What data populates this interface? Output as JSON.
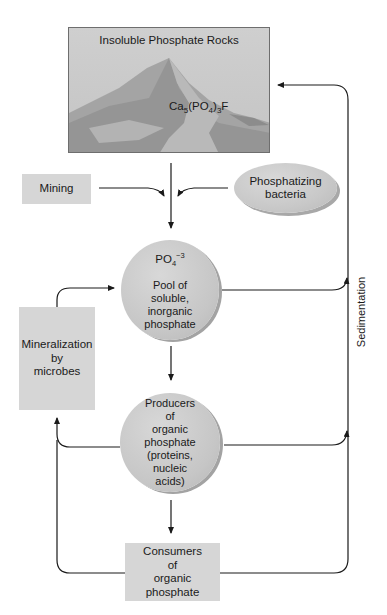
{
  "rocks": {
    "title": "Insoluble Phosphate Rocks",
    "formula": {
      "ca": "Ca",
      "ca_sub": "5",
      "po": "(PO",
      "po_sub": "4",
      "close": ")",
      "close_sub": "3",
      "f": "F"
    }
  },
  "mining": {
    "label": "Mining"
  },
  "bacteria": {
    "line1": "Phosphatizing",
    "line2": "bacteria"
  },
  "pool": {
    "ion": "PO",
    "ion_sub": "4",
    "ion_sup": "−3",
    "lines": [
      "Pool of",
      "soluble,",
      "inorganic",
      "phosphate"
    ]
  },
  "mineralization": {
    "lines": [
      "Mineralization",
      "by",
      "microbes"
    ]
  },
  "producers": {
    "lines": [
      "Producers",
      "of",
      "organic",
      "phosphate",
      "(proteins,",
      "nucleic",
      "acids)"
    ]
  },
  "consumers": {
    "lines": [
      "Consumers",
      "of",
      "organic",
      "phosphate"
    ]
  },
  "sedimentation": {
    "label": "Sedimentation"
  },
  "colors": {
    "box_fill": "#d6d6d6",
    "circle_fill": "#c8c8c8",
    "line": "#1a1a1a",
    "background": "#ffffff"
  }
}
